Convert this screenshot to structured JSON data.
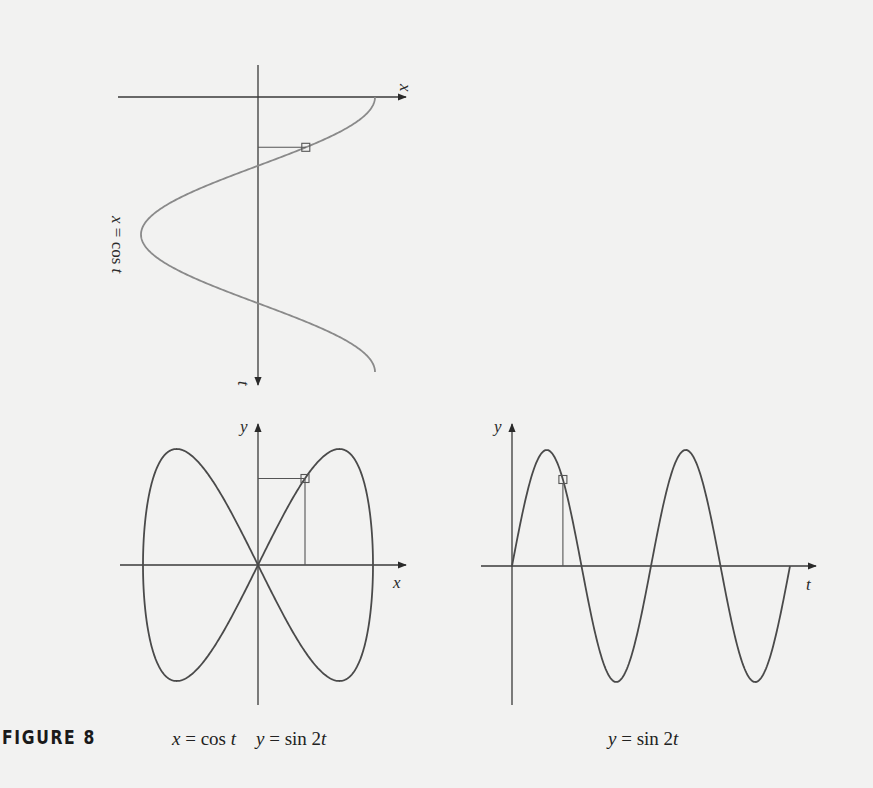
{
  "figure": {
    "label": "FIGURE 8",
    "caption_left": "x = cos t    y = sin 2t",
    "caption_left_x": "x = cos t",
    "caption_left_y": "y = sin 2t",
    "caption_right": "y = sin 2t"
  },
  "colors": {
    "background": "#f2f2f1",
    "top_curve": "#8a8a8a",
    "bottom_curves": "#4a4a4a",
    "axes": "#3a3a3a"
  },
  "chart_data": [
    {
      "id": "top",
      "type": "line",
      "title": "",
      "description": "x = cos t plotted with t axis pointing downward",
      "rotated_label": "x = cos t",
      "xlabel": "x",
      "ylabel": "t",
      "t_range": [
        0,
        6.283
      ],
      "x_range": [
        -1,
        1
      ],
      "equation": "x = cos t",
      "highlight_point": {
        "t": 1.15,
        "x": 0.41
      },
      "grid": false
    },
    {
      "id": "bottom-left",
      "type": "line",
      "title": "",
      "description": "Parametric curve (figure-eight / Lissajous)",
      "caption": "x = cos t    y = sin 2t",
      "xlabel": "x",
      "ylabel": "y",
      "x_range": [
        -1,
        1
      ],
      "y_range": [
        -1,
        1
      ],
      "equation_x": "cos t",
      "equation_y": "sin 2t",
      "t_range": [
        0,
        6.283
      ],
      "highlight_point": {
        "t": 1.15,
        "x": 0.41,
        "y": 0.745
      },
      "grid": false
    },
    {
      "id": "bottom-right",
      "type": "line",
      "title": "",
      "caption": "y = sin 2t",
      "xlabel": "t",
      "ylabel": "y",
      "t_range": [
        0,
        6.283
      ],
      "y_range": [
        -1,
        1
      ],
      "equation": "y = sin 2t",
      "periods_shown": 2,
      "highlight_point": {
        "t": 1.15,
        "y": 0.745
      },
      "grid": false
    }
  ]
}
